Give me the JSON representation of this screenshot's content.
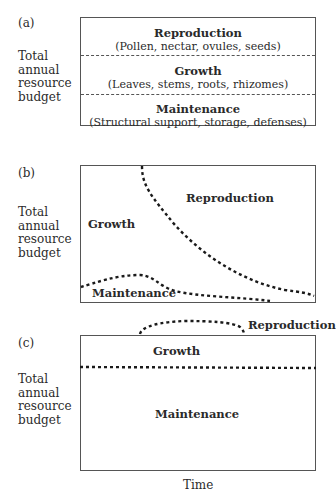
{
  "panels": {
    "a": {
      "label": "(a)",
      "ylabel": [
        "Total",
        "annual",
        "resource",
        "budget"
      ],
      "sections": [
        {
          "title": "Reproduction",
          "detail": "(Pollen, nectar, ovules, seeds)"
        },
        {
          "title": "Growth",
          "detail": "(Leaves, stems, roots, rhizomes)"
        },
        {
          "title": "Maintenance",
          "detail": "(Structural support, storage, defenses)"
        }
      ]
    },
    "b": {
      "label": "(b)",
      "ylabel": [
        "Total",
        "annual",
        "resource",
        "budget"
      ],
      "regions": {
        "reproduction": "Reproduction",
        "growth": "Growth",
        "maintenance": "Maintenance"
      }
    },
    "c": {
      "label": "(c)",
      "ylabel": [
        "Total",
        "annual",
        "resource",
        "budget"
      ],
      "regions": {
        "reproduction": "Reproduction",
        "growth": "Growth",
        "maintenance": "Maintenance"
      },
      "xlabel": "Time"
    }
  }
}
